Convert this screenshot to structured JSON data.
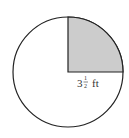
{
  "diagram": {
    "type": "circle-with-shaded-quarter-sector",
    "label": {
      "whole": "3",
      "numerator": "1",
      "denominator": "2",
      "unit": "ft"
    },
    "shaded_sector": "upper-right quarter",
    "colors": {
      "shade": "#cccccc",
      "stroke": "#222222",
      "background": "#ffffff"
    }
  }
}
